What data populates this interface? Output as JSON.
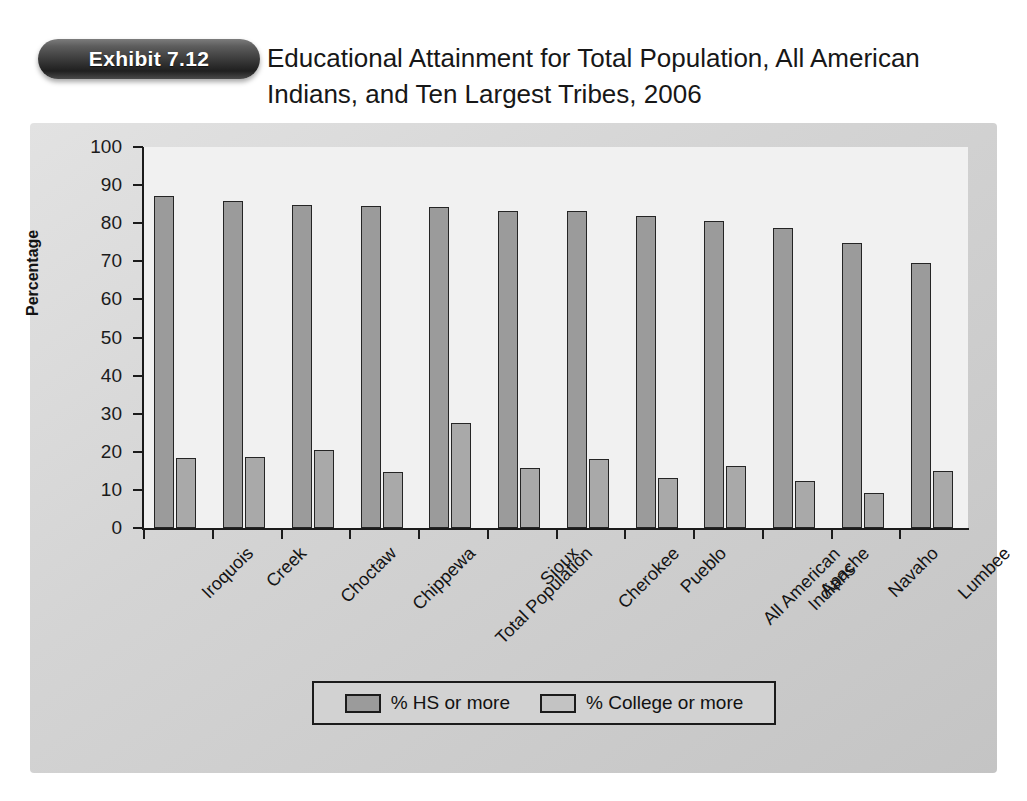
{
  "header": {
    "badge_label": "Exhibit 7.12",
    "title": "Educational Attainment for Total Population, All American Indians, and Ten Largest Tribes, 2006"
  },
  "chart_data": {
    "type": "bar",
    "title": "Educational Attainment for Total Population, All American Indians, and Ten Largest Tribes, 2006",
    "xlabel": "",
    "ylabel": "Percentage",
    "ylim": [
      0,
      100
    ],
    "yticks": [
      0,
      10,
      20,
      30,
      40,
      50,
      60,
      70,
      80,
      90,
      100
    ],
    "grid": false,
    "legend_position": "bottom",
    "categories": [
      "Iroquois",
      "Creek",
      "Choctaw",
      "Chippewa",
      "Total Population",
      "Sioux",
      "Cherokee",
      "Pueblo",
      "All American Indians",
      "Apache",
      "Navaho",
      "Lumbee"
    ],
    "series": [
      {
        "name": "% HS or more",
        "color": "#9b9b9b",
        "values": [
          87.2,
          85.9,
          84.7,
          84.6,
          84.3,
          83.1,
          83.1,
          81.8,
          80.6,
          78.8,
          74.9,
          69.5
        ]
      },
      {
        "name": "% College or more",
        "color": "#a9a9a9",
        "values": [
          18.5,
          18.7,
          20.5,
          14.6,
          27.6,
          15.8,
          18.1,
          13.1,
          16.3,
          12.3,
          9.3,
          14.9
        ]
      }
    ]
  },
  "legend": {
    "items": [
      {
        "label": "% HS or more"
      },
      {
        "label": "% College or more"
      }
    ]
  }
}
